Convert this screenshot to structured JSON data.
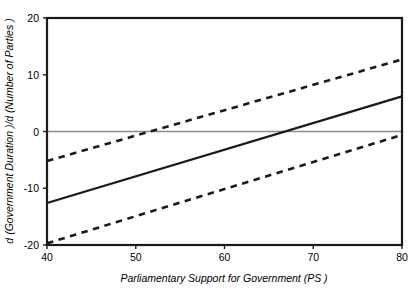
{
  "chart_data": {
    "type": "line",
    "title": "",
    "xlabel": "Parliamentary Support for Government  (PS )",
    "ylabel": "d (Government Duration )/d (Number of Parties )",
    "xlim": [
      40,
      80
    ],
    "ylim": [
      -20,
      20
    ],
    "xticks": [
      40,
      50,
      60,
      70,
      80
    ],
    "yticks": [
      -20,
      -10,
      0,
      10,
      20
    ],
    "xtick_labels": [
      "40",
      "50",
      "60",
      "70",
      "80"
    ],
    "ytick_labels": [
      "-20",
      "-10",
      "0",
      "10",
      "20"
    ],
    "grid": false,
    "legend": "none",
    "zero_reference_line": 0,
    "x": [
      40,
      80
    ],
    "series": [
      {
        "name": "upper-confidence-bound",
        "style": "dashed",
        "values": [
          -5.2,
          12.7
        ]
      },
      {
        "name": "marginal-effect-estimate",
        "style": "solid",
        "values": [
          -12.6,
          6.2
        ]
      },
      {
        "name": "lower-confidence-bound",
        "style": "dashed",
        "values": [
          -19.7,
          -0.6
        ]
      }
    ],
    "zero_crossing_x": 66.8,
    "colors": {
      "line": "#1a1a1a",
      "zero_line": "#8c8c8c",
      "frame": "#1a1a1a",
      "background": "#ffffff"
    }
  }
}
